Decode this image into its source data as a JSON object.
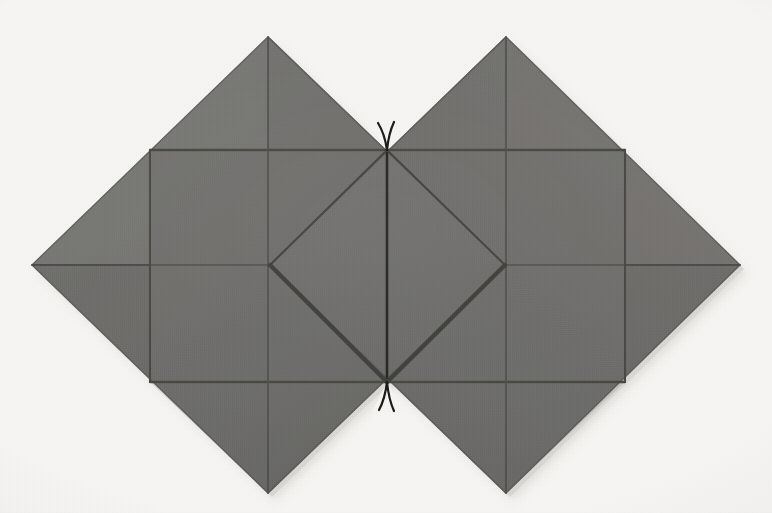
{
  "scene": {
    "title": "Folded paper crease-pattern photograph",
    "description": "Two overlapping gray diamond (square rotated 45 degrees) paper panels joined at center, with crease grid lines and two thin black thread marks at the top and bottom center vertices.",
    "subject": "origami-crease-pattern",
    "canvas": {
      "width": 772,
      "height": 513
    }
  },
  "colors": {
    "background": "#f7f6f4",
    "paper_fill": "#6d6c6a",
    "paper_fill_light": "#787775",
    "paper_fill_dark": "#636261",
    "paper_edge": "#5a5958",
    "crease_line": "#4a4948",
    "crease_line_strong": "#4e4d4c",
    "thread_black": "#171615",
    "shadow": "#cfcbc7"
  },
  "geometry": {
    "left_diamond": {
      "name": "left-diamond-panel",
      "top": [
        268,
        37
      ],
      "right": [
        505,
        265
      ],
      "bottom": [
        268,
        493
      ],
      "left": [
        32,
        265
      ]
    },
    "right_diamond": {
      "name": "right-diamond-panel",
      "top": [
        506,
        37
      ],
      "right": [
        740,
        265
      ],
      "bottom": [
        506,
        493
      ],
      "left": [
        270,
        265
      ]
    },
    "center_top_vertex": [
      387,
      150
    ],
    "center_bottom_vertex": [
      387,
      382
    ],
    "inner_diamond": [
      [
        387,
        150
      ],
      [
        505,
        265
      ],
      [
        387,
        382
      ],
      [
        270,
        265
      ]
    ],
    "horizontal_creases_y": [
      150,
      382
    ],
    "vertical_creases_x": [
      150,
      387,
      625
    ],
    "center_vertical_crease_x": 387
  },
  "elements": {
    "left_panel_label": "Left diamond panel",
    "right_panel_label": "Right diamond panel",
    "inner_diamond_label": "Central overlapping diamond",
    "top_thread_label": "Top needle thread mark",
    "bottom_thread_label": "Bottom needle thread mark",
    "center_spine_label": "Central vertical crease",
    "upper_crease_label": "Upper horizontal crease",
    "lower_crease_label": "Lower horizontal crease"
  },
  "chart_data": {
    "type": "diagram",
    "shapes": [
      {
        "id": "left-diamond",
        "kind": "polygon",
        "points": [
          [
            268,
            37
          ],
          [
            505,
            265
          ],
          [
            268,
            493
          ],
          [
            32,
            265
          ]
        ],
        "fill": "#6d6c6a"
      },
      {
        "id": "right-diamond",
        "kind": "polygon",
        "points": [
          [
            506,
            37
          ],
          [
            740,
            265
          ],
          [
            506,
            493
          ],
          [
            270,
            265
          ]
        ],
        "fill": "#6d6c6a"
      }
    ],
    "creases": [
      {
        "id": "upper-horizontal",
        "from": [
          150,
          150
        ],
        "to": [
          625,
          150
        ],
        "weight": 2.2
      },
      {
        "id": "lower-horizontal",
        "from": [
          150,
          382
        ],
        "to": [
          625,
          382
        ],
        "weight": 2.2
      },
      {
        "id": "left-vertical",
        "from": [
          150,
          150
        ],
        "to": [
          150,
          382
        ],
        "weight": 2.0
      },
      {
        "id": "right-vertical",
        "from": [
          625,
          150
        ],
        "to": [
          625,
          382
        ],
        "weight": 2.0
      },
      {
        "id": "center-vertical",
        "from": [
          387,
          150
        ],
        "to": [
          387,
          382
        ],
        "weight": 2.4
      },
      {
        "id": "left-diamond-vertical",
        "from": [
          268,
          37
        ],
        "to": [
          268,
          493
        ],
        "weight": 1.8
      },
      {
        "id": "right-diamond-vertical",
        "from": [
          506,
          37
        ],
        "to": [
          506,
          493
        ],
        "weight": 1.8
      },
      {
        "id": "inner-upper-left",
        "from": [
          270,
          265
        ],
        "to": [
          387,
          150
        ],
        "weight": 2.0
      },
      {
        "id": "inner-upper-right",
        "from": [
          505,
          265
        ],
        "to": [
          387,
          150
        ],
        "weight": 2.0
      },
      {
        "id": "inner-lower-left",
        "from": [
          270,
          265
        ],
        "to": [
          387,
          382
        ],
        "weight": 4.0
      },
      {
        "id": "inner-lower-right",
        "from": [
          505,
          265
        ],
        "to": [
          387,
          382
        ],
        "weight": 4.0
      }
    ],
    "threads": [
      {
        "id": "top-thread-left",
        "vertex": [
          387,
          150
        ],
        "tip": [
          378,
          123
        ]
      },
      {
        "id": "top-thread-right",
        "vertex": [
          387,
          150
        ],
        "tip": [
          394,
          122
        ]
      },
      {
        "id": "bottom-thread-left",
        "vertex": [
          387,
          382
        ],
        "tip": [
          379,
          410
        ]
      },
      {
        "id": "bottom-thread-right",
        "vertex": [
          387,
          382
        ],
        "tip": [
          394,
          411
        ]
      }
    ]
  }
}
